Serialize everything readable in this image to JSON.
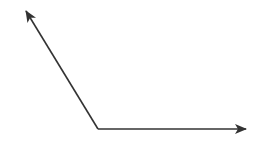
{
  "diagram": {
    "type": "angle-vectors",
    "stroke_color": "#333333",
    "background": "#ffffff",
    "vertex": {
      "x": 98,
      "y": 129
    },
    "vectors": [
      {
        "name": "vector-up-left",
        "tip": {
          "x": 26,
          "y": 11
        }
      },
      {
        "name": "vector-right",
        "tip": {
          "x": 246,
          "y": 129
        }
      }
    ]
  }
}
